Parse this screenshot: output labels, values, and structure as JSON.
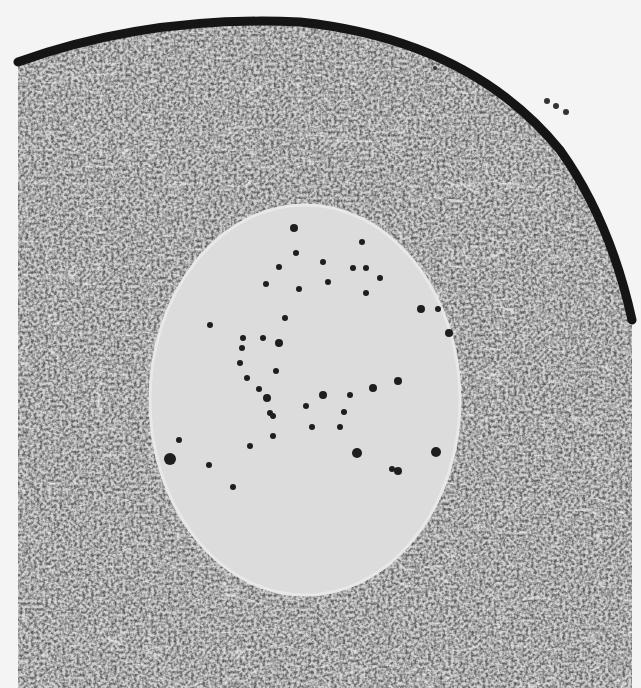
{
  "image": {
    "kind": "grayscale micrograph",
    "subject": "histological section of a cell with large pale nucleus containing dark nucleoli",
    "colors": {
      "background": "#f4f4f4",
      "cytoplasm": "#8a8a8a",
      "cytoplasm_light": "#cfcfcf",
      "membrane": "#151515",
      "nucleus": "#dcdcdc",
      "nucleolus": "#1e1e1e"
    }
  },
  "nucleus": {
    "cx": 305,
    "cy": 400,
    "rx": 155,
    "ry": 195
  },
  "nucleoli": [
    [
      294,
      228,
      4
    ],
    [
      296,
      253,
      3
    ],
    [
      362,
      242,
      3
    ],
    [
      323,
      262,
      3
    ],
    [
      279,
      267,
      3
    ],
    [
      353,
      268,
      3
    ],
    [
      366,
      268,
      3
    ],
    [
      380,
      278,
      3
    ],
    [
      299,
      289,
      3
    ],
    [
      266,
      284,
      3
    ],
    [
      328,
      282,
      3
    ],
    [
      366,
      293,
      3
    ],
    [
      421,
      309,
      4
    ],
    [
      438,
      309,
      3
    ],
    [
      449,
      333,
      4
    ],
    [
      285,
      318,
      3
    ],
    [
      210,
      325,
      3
    ],
    [
      243,
      338,
      3
    ],
    [
      263,
      338,
      3
    ],
    [
      279,
      343,
      4
    ],
    [
      240,
      363,
      3
    ],
    [
      242,
      348,
      3
    ],
    [
      247,
      378,
      3
    ],
    [
      259,
      389,
      3
    ],
    [
      276,
      371,
      3
    ],
    [
      267,
      398,
      4
    ],
    [
      323,
      395,
      4
    ],
    [
      373,
      388,
      4
    ],
    [
      398,
      381,
      4
    ],
    [
      306,
      406,
      3
    ],
    [
      350,
      395,
      3
    ],
    [
      344,
      412,
      3
    ],
    [
      312,
      427,
      3
    ],
    [
      340,
      427,
      3
    ],
    [
      273,
      416,
      3
    ],
    [
      273,
      436,
      3
    ],
    [
      250,
      446,
      3
    ],
    [
      270,
      413,
      3
    ],
    [
      179,
      440,
      3
    ],
    [
      170,
      459,
      6
    ],
    [
      209,
      465,
      3
    ],
    [
      357,
      453,
      5
    ],
    [
      436,
      452,
      5
    ],
    [
      398,
      471,
      4
    ],
    [
      233,
      487,
      3
    ],
    [
      392,
      469,
      3
    ]
  ]
}
